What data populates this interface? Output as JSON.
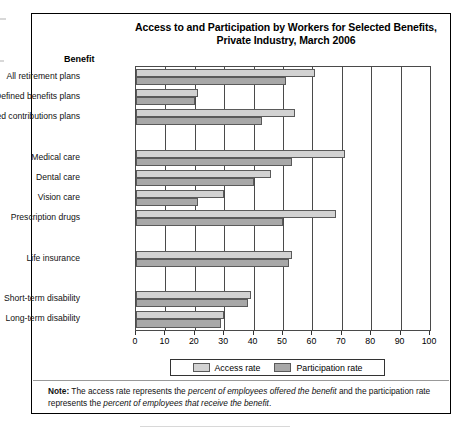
{
  "figure": {
    "title_line1": "Access to and Participation by Workers for Selected Benefits,",
    "title_line2": "Private Industry, March 2006",
    "axis_header": "Benefit",
    "note_label": "Note:",
    "note_part1": "The access rate represents the ",
    "note_em1": "percent of employees offered the benefit",
    "note_part2": " and the participation rate represents the ",
    "note_em2": "percent of employees that receive the benefit",
    "note_part3": "."
  },
  "legend": {
    "access_label": "Access rate",
    "participation_label": "Participation rate"
  },
  "colors": {
    "access": "#d2d2d2",
    "participation": "#a8a8a8",
    "axis": "#4a4a4a",
    "text": "#000000"
  },
  "chart_data": {
    "type": "bar",
    "orientation": "horizontal",
    "title": "Access to and Participation by Workers for Selected Benefits, Private Industry, March 2006",
    "xlabel": "",
    "ylabel": "Benefit",
    "xlim": [
      0,
      100
    ],
    "xticks": [
      0,
      10,
      20,
      30,
      40,
      50,
      60,
      70,
      80,
      90,
      100
    ],
    "grid": true,
    "legend_position": "bottom",
    "categories": [
      "All retirement plans",
      "Defined benefits plans",
      "Defined contributions plans",
      "Medical care",
      "Dental care",
      "Vision care",
      "Prescription drugs",
      "Life insurance",
      "Short-term disability",
      "Long-term disability"
    ],
    "groups": [
      {
        "start": 0,
        "count": 3
      },
      {
        "start": 3,
        "count": 4
      },
      {
        "start": 7,
        "count": 1
      },
      {
        "start": 8,
        "count": 2
      }
    ],
    "series": [
      {
        "name": "Access rate",
        "values": [
          61,
          21,
          54,
          71,
          46,
          30,
          68,
          53,
          39,
          30
        ]
      },
      {
        "name": "Participation rate",
        "values": [
          51,
          20,
          43,
          53,
          40,
          21,
          50,
          52,
          38,
          29
        ]
      }
    ]
  }
}
